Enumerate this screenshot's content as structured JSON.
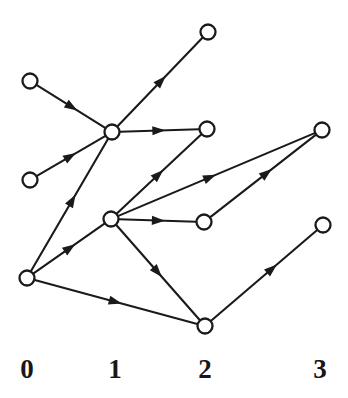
{
  "figure": {
    "background_color": "#ffffff",
    "ink_color": "#1a1a1a",
    "width": 348,
    "height": 398
  },
  "layer_axis": {
    "labels": [
      {
        "text": "0",
        "x": 27,
        "y": 378
      },
      {
        "text": "1",
        "x": 115,
        "y": 378
      },
      {
        "text": "2",
        "x": 205,
        "y": 378
      },
      {
        "text": "3",
        "x": 320,
        "y": 378
      }
    ]
  },
  "graph": {
    "node_radius": 7.5,
    "nodes": [
      {
        "id": "n0a",
        "layer": "0",
        "x": 30,
        "y": 81
      },
      {
        "id": "n0b",
        "layer": "0",
        "x": 30,
        "y": 180
      },
      {
        "id": "n0c",
        "layer": "0",
        "x": 27,
        "y": 278
      },
      {
        "id": "n1a",
        "layer": "1",
        "x": 112,
        "y": 132
      },
      {
        "id": "n1b",
        "layer": "1",
        "x": 111,
        "y": 219
      },
      {
        "id": "n2a",
        "layer": "2",
        "x": 208,
        "y": 32
      },
      {
        "id": "n2b",
        "layer": "2",
        "x": 207,
        "y": 129
      },
      {
        "id": "n2c",
        "layer": "2",
        "x": 204,
        "y": 222
      },
      {
        "id": "n2d",
        "layer": "2",
        "x": 205,
        "y": 326
      },
      {
        "id": "n3a",
        "layer": "3",
        "x": 322,
        "y": 130
      },
      {
        "id": "n3b",
        "layer": "3",
        "x": 323,
        "y": 225
      }
    ],
    "edges": [
      {
        "from": "n0a",
        "to": "n1a",
        "arrow_at": 0.52
      },
      {
        "from": "n0b",
        "to": "n1a",
        "arrow_at": 0.5
      },
      {
        "from": "n0c",
        "to": "n1a",
        "arrow_at": 0.54
      },
      {
        "from": "n0c",
        "to": "n1b",
        "arrow_at": 0.52
      },
      {
        "from": "n0c",
        "to": "n2d",
        "arrow_at": 0.5
      },
      {
        "from": "n1a",
        "to": "n2a",
        "arrow_at": 0.52
      },
      {
        "from": "n1a",
        "to": "n2b",
        "arrow_at": 0.5
      },
      {
        "from": "n1b",
        "to": "n2b",
        "arrow_at": 0.5
      },
      {
        "from": "n1b",
        "to": "n2c",
        "arrow_at": 0.52
      },
      {
        "from": "n1b",
        "to": "n2d",
        "arrow_at": 0.5
      },
      {
        "from": "n1b",
        "to": "n3a",
        "arrow_at": 0.47
      },
      {
        "from": "n2c",
        "to": "n3a",
        "arrow_at": 0.54
      },
      {
        "from": "n2d",
        "to": "n3b",
        "arrow_at": 0.58
      }
    ]
  }
}
